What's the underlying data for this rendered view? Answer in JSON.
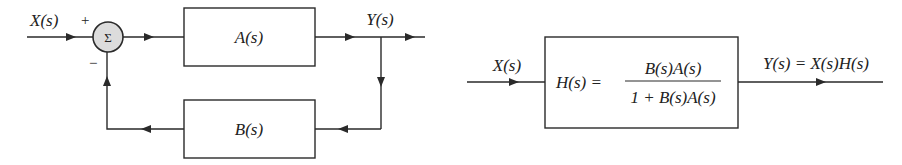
{
  "left_diagram": {
    "input_label": "X(s)",
    "output_label": "Y(s)",
    "summing_junction": {
      "symbol": "Σ",
      "plus_sign": "+",
      "minus_sign": "−"
    },
    "forward_block": {
      "label": "A(s)"
    },
    "feedback_block": {
      "label": "B(s)"
    }
  },
  "right_diagram": {
    "input_label": "X(s)",
    "block": {
      "lhs": "H(s) =",
      "numerator": "B(s)A(s)",
      "denominator": "1 + B(s)A(s)"
    },
    "output_label": "Y(s) = X(s)H(s)"
  },
  "colors": {
    "line": "#2a2a2a",
    "sum_fill": "#dcdcdc",
    "background": "#ffffff"
  }
}
